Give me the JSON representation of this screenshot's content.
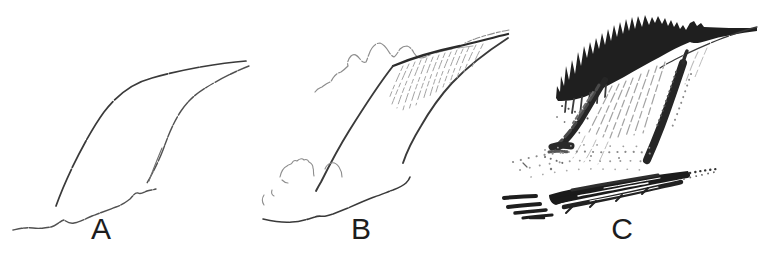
{
  "panels": [
    {
      "label": "A",
      "sketch": "waterfall-outline-sketch"
    },
    {
      "label": "B",
      "sketch": "waterfall-sketch-with-treeline-streaks-and-mist"
    },
    {
      "label": "C",
      "sketch": "waterfall-fully-shaded-with-trees-spray-and-rocks"
    }
  ],
  "colors": {
    "background": "#ffffff",
    "ink": "#262626",
    "light_pencil": "#9a9a9a",
    "label_text": "#1d1d1d"
  }
}
